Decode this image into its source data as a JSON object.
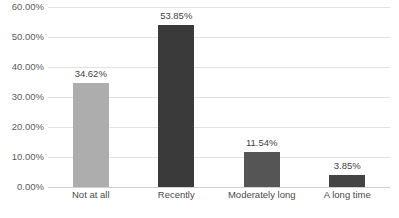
{
  "chart_data": {
    "type": "bar",
    "title": "",
    "subtitle": "",
    "xlabel": "",
    "ylabel": "",
    "categories": [
      "Not at all",
      "Recently",
      "Moderately long",
      "A long time"
    ],
    "values": [
      34.62,
      53.85,
      11.54,
      3.85
    ],
    "data_labels": [
      "34.62%",
      "53.85%",
      "11.54%",
      "3.85%"
    ],
    "bar_colors": [
      "#adadad",
      "#3a3a3a",
      "#555555",
      "#444444"
    ],
    "ylim": [
      0,
      60
    ],
    "ytick_values": [
      0,
      10,
      20,
      30,
      40,
      50,
      60
    ],
    "ytick_labels": [
      "0.00%",
      "10.00%",
      "20.00%",
      "30.00%",
      "40.00%",
      "50.00%",
      "60.00%"
    ],
    "grid": true,
    "grid_color": "#e2e2e2",
    "legend": null,
    "legend_position": "none"
  },
  "caption": {
    "cutoff_line": ""
  }
}
